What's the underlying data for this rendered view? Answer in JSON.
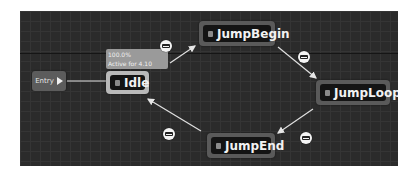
{
  "graph": {
    "entry": {
      "label": "Entry",
      "icon": "play-icon"
    },
    "debug_tooltip": {
      "weight": "100.0%",
      "active_time": "Active for 4.10 secs"
    },
    "states": [
      {
        "id": "idle",
        "label": "Idle",
        "active": true
      },
      {
        "id": "jump-begin",
        "label": "JumpBegin",
        "active": false
      },
      {
        "id": "jump-loop",
        "label": "JumpLoop",
        "active": false
      },
      {
        "id": "jump-end",
        "label": "JumpEnd",
        "active": false
      }
    ],
    "transitions": [
      {
        "from": "Entry",
        "to": "Idle",
        "icon": "none"
      },
      {
        "from": "Idle",
        "to": "JumpBegin",
        "icon": "transition-rule-icon"
      },
      {
        "from": "JumpBegin",
        "to": "JumpLoop",
        "icon": "transition-rule-icon"
      },
      {
        "from": "JumpLoop",
        "to": "JumpEnd",
        "icon": "transition-rule-icon"
      },
      {
        "from": "JumpEnd",
        "to": "Idle",
        "icon": "transition-rule-icon"
      }
    ],
    "colors": {
      "canvas": "#2b2b2b",
      "node_frame": "#5a5a5a",
      "active_node_frame": "#b9b9b9",
      "node_body": "#141414",
      "wire": "#e0e0e0"
    }
  }
}
